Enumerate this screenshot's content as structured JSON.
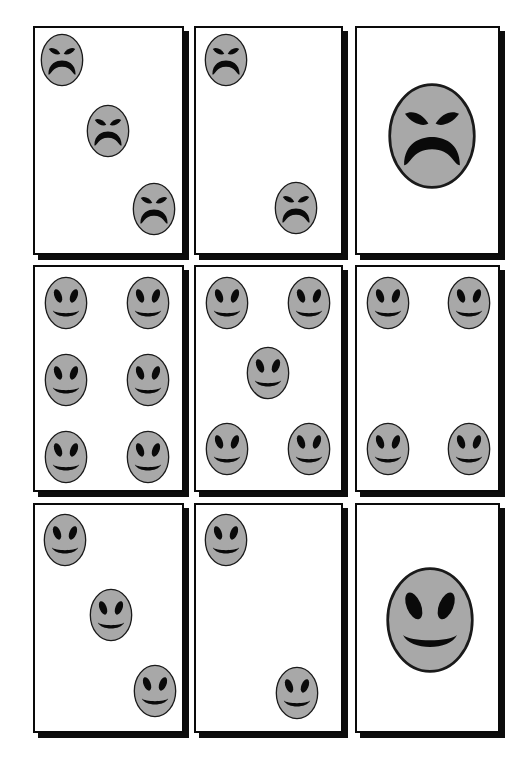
{
  "figure": {
    "name": "emotional-face-stimulus-grid",
    "rows": 3,
    "columns": 3,
    "background_color": "#ffffff",
    "panel_border_color": "#0a0a0a",
    "panel_shadow_color": "#0d0d0d",
    "face_fill_color": "#a8a8a8",
    "face_outline_color": "#1a1a1a",
    "feature_color": "#0a0a0a"
  },
  "panels": [
    {
      "id": "panel-r1c1",
      "row": 1,
      "column": 1,
      "expression": "angry",
      "face_count": 3,
      "layout": "diagonal",
      "x": 33,
      "y": 26,
      "w": 151,
      "h": 229,
      "faces": [
        {
          "cx": 27,
          "cy": 32,
          "rx": 22,
          "ry": 27
        },
        {
          "cx": 73,
          "cy": 103,
          "rx": 22,
          "ry": 27
        },
        {
          "cx": 119,
          "cy": 181,
          "rx": 22,
          "ry": 27
        }
      ]
    },
    {
      "id": "panel-r1c2",
      "row": 1,
      "column": 2,
      "expression": "angry",
      "face_count": 2,
      "layout": "diagonal",
      "x": 194,
      "y": 26,
      "w": 149,
      "h": 229,
      "faces": [
        {
          "cx": 30,
          "cy": 32,
          "rx": 22,
          "ry": 27
        },
        {
          "cx": 100,
          "cy": 180,
          "rx": 22,
          "ry": 27
        }
      ]
    },
    {
      "id": "panel-r1c3",
      "row": 1,
      "column": 3,
      "expression": "angry",
      "face_count": 1,
      "layout": "single-large-centered",
      "x": 355,
      "y": 26,
      "w": 145,
      "h": 229,
      "faces": [
        {
          "cx": 75,
          "cy": 108,
          "rx": 45,
          "ry": 54
        }
      ]
    },
    {
      "id": "panel-r2c1",
      "row": 2,
      "column": 1,
      "expression": "happy",
      "face_count": 6,
      "layout": "two-by-three-grid",
      "x": 33,
      "y": 265,
      "w": 151,
      "h": 227,
      "faces": [
        {
          "cx": 31,
          "cy": 36,
          "rx": 22,
          "ry": 27
        },
        {
          "cx": 113,
          "cy": 36,
          "rx": 22,
          "ry": 27
        },
        {
          "cx": 31,
          "cy": 113,
          "rx": 22,
          "ry": 27
        },
        {
          "cx": 113,
          "cy": 113,
          "rx": 22,
          "ry": 27
        },
        {
          "cx": 31,
          "cy": 190,
          "rx": 22,
          "ry": 27
        },
        {
          "cx": 113,
          "cy": 190,
          "rx": 22,
          "ry": 27
        }
      ]
    },
    {
      "id": "panel-r2c2",
      "row": 2,
      "column": 2,
      "expression": "happy",
      "face_count": 5,
      "layout": "quincunx",
      "x": 194,
      "y": 265,
      "w": 149,
      "h": 227,
      "faces": [
        {
          "cx": 31,
          "cy": 36,
          "rx": 22,
          "ry": 27
        },
        {
          "cx": 113,
          "cy": 36,
          "rx": 22,
          "ry": 27
        },
        {
          "cx": 72,
          "cy": 106,
          "rx": 22,
          "ry": 27
        },
        {
          "cx": 31,
          "cy": 182,
          "rx": 22,
          "ry": 27
        },
        {
          "cx": 113,
          "cy": 182,
          "rx": 22,
          "ry": 27
        }
      ]
    },
    {
      "id": "panel-r2c3",
      "row": 2,
      "column": 3,
      "expression": "happy",
      "face_count": 4,
      "layout": "four-corners",
      "x": 355,
      "y": 265,
      "w": 145,
      "h": 227,
      "faces": [
        {
          "cx": 31,
          "cy": 36,
          "rx": 22,
          "ry": 27
        },
        {
          "cx": 112,
          "cy": 36,
          "rx": 22,
          "ry": 27
        },
        {
          "cx": 31,
          "cy": 182,
          "rx": 22,
          "ry": 27
        },
        {
          "cx": 112,
          "cy": 182,
          "rx": 22,
          "ry": 27
        }
      ]
    },
    {
      "id": "panel-r3c1",
      "row": 3,
      "column": 1,
      "expression": "happy",
      "face_count": 3,
      "layout": "diagonal",
      "x": 33,
      "y": 503,
      "w": 151,
      "h": 230,
      "faces": [
        {
          "cx": 30,
          "cy": 35,
          "rx": 22,
          "ry": 27
        },
        {
          "cx": 76,
          "cy": 110,
          "rx": 22,
          "ry": 27
        },
        {
          "cx": 120,
          "cy": 186,
          "rx": 22,
          "ry": 27
        }
      ]
    },
    {
      "id": "panel-r3c2",
      "row": 3,
      "column": 2,
      "expression": "happy",
      "face_count": 2,
      "layout": "diagonal",
      "x": 194,
      "y": 503,
      "w": 149,
      "h": 230,
      "faces": [
        {
          "cx": 30,
          "cy": 35,
          "rx": 22,
          "ry": 27
        },
        {
          "cx": 101,
          "cy": 188,
          "rx": 22,
          "ry": 27
        }
      ]
    },
    {
      "id": "panel-r3c3",
      "row": 3,
      "column": 3,
      "expression": "happy",
      "face_count": 1,
      "layout": "single-large-centered",
      "x": 355,
      "y": 503,
      "w": 145,
      "h": 230,
      "faces": [
        {
          "cx": 73,
          "cy": 115,
          "rx": 45,
          "ry": 54
        }
      ]
    }
  ]
}
